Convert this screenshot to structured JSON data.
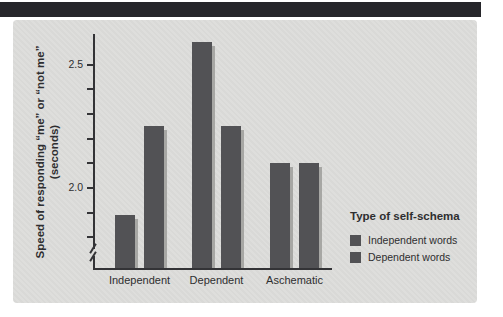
{
  "figure": {
    "banner_color": "#26262a",
    "panel_color": "#dcdcda",
    "bar_color": "#525255",
    "shadow_color": "#a7a7a4",
    "axis_color": "#333336",
    "text_color": "#2e2e30",
    "page_background": "#ffffff"
  },
  "chart_data": {
    "type": "bar",
    "categories": [
      "Independent",
      "Dependent",
      "Aschematic"
    ],
    "series": [
      {
        "name": "Independent words",
        "values": [
          1.89,
          2.59,
          2.1
        ]
      },
      {
        "name": "Dependent words",
        "values": [
          2.25,
          2.25,
          2.1
        ]
      }
    ],
    "title": "",
    "xlabel": "",
    "ylabel_line1": "Speed of responding “me” or “not me”",
    "ylabel_line2": "(seconds)",
    "ylim": [
      1.68,
      2.62
    ],
    "yticks_labeled": [
      2.5,
      2.0
    ],
    "ytick_labels": [
      "2.5",
      "2.0"
    ],
    "ytick_minor_step": 0.1,
    "ytick_minor_range": [
      1.8,
      2.5
    ],
    "axis_break": true,
    "grid": false,
    "legend_title": "Type of self-schema",
    "legend_position": "right"
  }
}
